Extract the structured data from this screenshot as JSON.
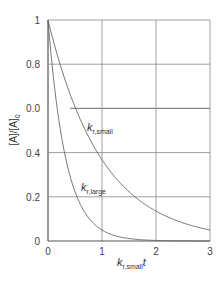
{
  "chart_data": {
    "type": "line",
    "title": "",
    "xlabel": "k_r,small t",
    "xlabel_main": "k",
    "xlabel_sub": "r,small",
    "xlabel_tail": "t",
    "ylabel": "[A]/[A]0",
    "ylabel_main": "[A]/[A]",
    "ylabel_sub": "0",
    "xlim": [
      0,
      3
    ],
    "ylim": [
      0,
      1
    ],
    "grid": true,
    "x_ticks": [
      "0",
      "1",
      "2",
      "3"
    ],
    "y_ticks": [
      "0",
      "0.2",
      "0.4",
      "0.0",
      "0.8",
      "1"
    ],
    "x": [
      0,
      0.25,
      0.5,
      0.75,
      1.0,
      1.25,
      1.5,
      1.75,
      2.0,
      2.25,
      2.5,
      2.75,
      3.0
    ],
    "series": [
      {
        "name": "k_r,small",
        "label_main": "k",
        "label_sub": "r,small",
        "values": [
          1.0,
          0.78,
          0.61,
          0.47,
          0.37,
          0.29,
          0.22,
          0.17,
          0.14,
          0.11,
          0.08,
          0.06,
          0.05
        ]
      },
      {
        "name": "k_r,large",
        "label_main": "k",
        "label_sub": "r,large",
        "values": [
          1.0,
          0.47,
          0.22,
          0.11,
          0.05,
          0.02,
          0.01,
          0.005,
          0.0025,
          0.001,
          0.0,
          0.0,
          0.0
        ]
      }
    ],
    "colors": {
      "axis": "#555555",
      "grid": "#888888",
      "curve": "#666666"
    }
  }
}
